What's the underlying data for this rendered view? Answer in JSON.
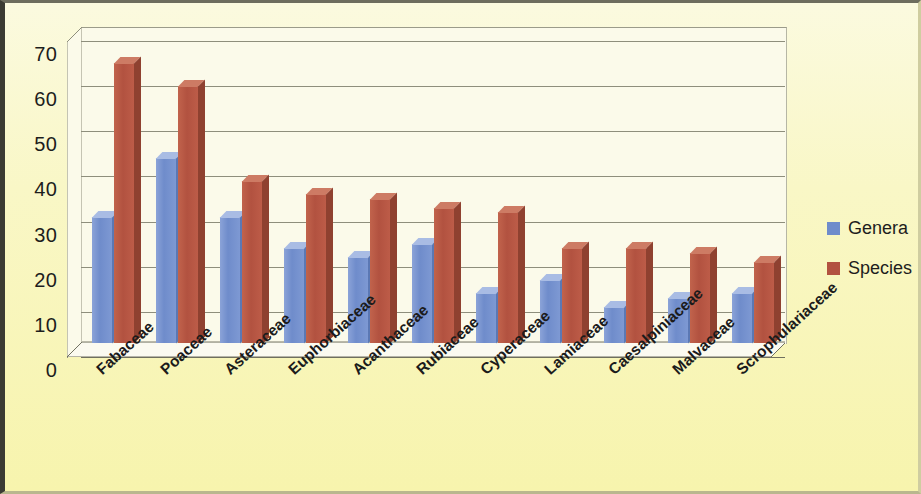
{
  "chart_data": {
    "type": "bar",
    "title": "",
    "subtitle": "",
    "xlabel": "",
    "ylabel": "",
    "ylim": [
      0,
      70
    ],
    "ytick_step": 10,
    "yticks": [
      70,
      60,
      50,
      40,
      30,
      20,
      10,
      0
    ],
    "grid": true,
    "legend_position": "right",
    "style": "3d-clustered-column",
    "categories": [
      "Fabaceae",
      "Poaceae",
      "Asteraceae",
      "Euphorbiaceae",
      "Acanthaceae",
      "Rubiaceae",
      "Cyperaceae",
      "Lamiaceae",
      "Caesalpiniaceae",
      "Malvaceae",
      "Scrophulariaceae"
    ],
    "series": [
      {
        "name": "Genera",
        "color": "#6f8ccb",
        "values": [
          28,
          41,
          28,
          21,
          19,
          22,
          11,
          14,
          8,
          10,
          11
        ]
      },
      {
        "name": "Species",
        "color": "#b25240",
        "values": [
          62,
          57,
          36,
          33,
          32,
          30,
          29,
          21,
          21,
          20,
          18
        ]
      }
    ]
  },
  "legend": {
    "items": [
      {
        "label": "Genera",
        "color": "#6f8ccb"
      },
      {
        "label": "Species",
        "color": "#b25240"
      }
    ]
  },
  "colors": {
    "plot_background": "#fbfaea",
    "chart_background": "#f7f4ad",
    "gridline": "#8e8e7c",
    "text": "#1d1d1d",
    "frame_border": "#3b3b33"
  }
}
